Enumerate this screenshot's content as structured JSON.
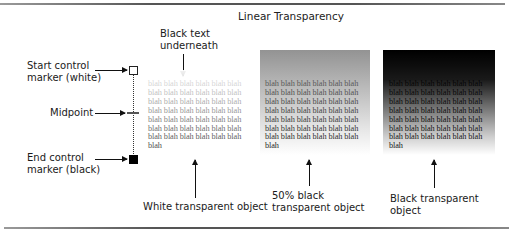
{
  "title": "Linear Transparency",
  "labels": {
    "black_text": "Black text\nunderneath",
    "start_marker": "Start control\nmarker (white)",
    "midpoint": "Midpoint",
    "end_marker": "End control\nmarker (black)",
    "white_object": "White transparent object",
    "gray_object": "50% black\ntransparent object",
    "black_object": "Black transparent object"
  },
  "sample_text": {
    "word": "blah",
    "columns": 6,
    "rows": 7,
    "trailing": "blah"
  },
  "colors": {
    "white_object": "#ffffff",
    "gray_object": "#808080",
    "black_object": "#000000",
    "text": "#222222"
  }
}
